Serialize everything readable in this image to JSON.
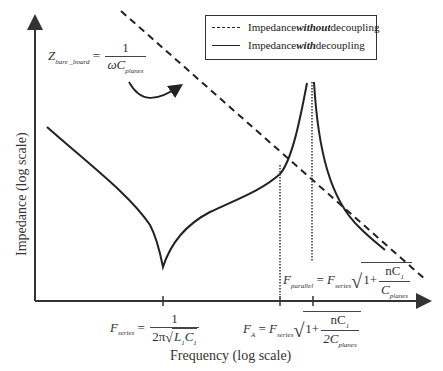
{
  "axes": {
    "y_label": "Impedance (log scale)",
    "x_label": "Frequency (log scale)"
  },
  "legend": {
    "items": [
      {
        "style": "dashed",
        "prefix": "Impedance ",
        "emphasis": "without",
        "suffix": " decoupling"
      },
      {
        "style": "solid",
        "prefix": "Impedance ",
        "emphasis": "with",
        "suffix": " decoupling"
      }
    ]
  },
  "annotations": {
    "z_bare_board": {
      "lhs": "Z",
      "lhs_sub": "bare _board",
      "num": "1",
      "den": "ωC",
      "den_sub": "planes"
    },
    "f_series": {
      "lhs": "F",
      "lhs_sub": "series",
      "num": "1",
      "den": "2π",
      "den_root": "L",
      "den_root_sub1": "1",
      "den_root2": "C",
      "den_root_sub2": "1"
    },
    "f_a": {
      "lhs": "F",
      "lhs_sub": "A",
      "rhs": "F",
      "rhs_sub": "series",
      "one_plus": "1+",
      "num": "nC",
      "num_sub": "1",
      "den": "2C",
      "den_sub": "planes"
    },
    "f_parallel": {
      "lhs": "F",
      "lhs_sub": "parallel",
      "rhs": "F",
      "rhs_sub": "series",
      "one_plus": "1+",
      "num": "nC",
      "num_sub": "1",
      "den": "C",
      "den_sub": "planes"
    }
  },
  "colors": {
    "line": "#222222",
    "axis": "#333333",
    "background": "#ffffff"
  }
}
